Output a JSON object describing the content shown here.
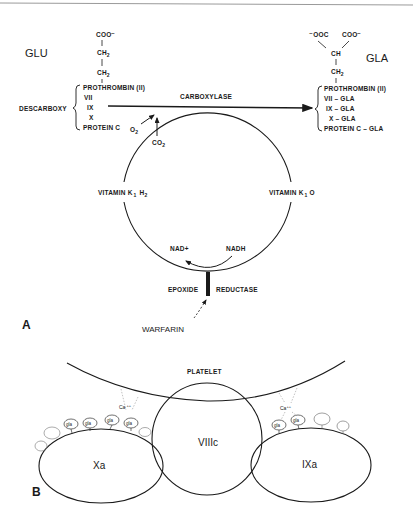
{
  "figure": {
    "panel_a": {
      "label": "A",
      "left": {
        "title": "GLU",
        "structure": [
          "COO⁻",
          "CH",
          "2",
          "CH",
          "2"
        ],
        "group_label": "DESCARBOXY",
        "proteins": [
          "PROTHROMBIN (II)",
          "VII",
          "IX",
          "X",
          "PROTEIN C"
        ]
      },
      "right": {
        "title": "GLA",
        "structure_top_left": "⁻OOC",
        "structure_top_right": "COO⁻",
        "ch": "CH",
        "ch2": "CH",
        "ch2_sub": "2",
        "proteins": [
          "PROTHROMBIN (II)",
          "VII – GLA",
          "IX – GLA",
          "X – GLA",
          "PROTEIN C – GLA"
        ]
      },
      "enzyme_top": "CARBOXYLASE",
      "o2": "O",
      "o2_sub": "2",
      "co2": "CO",
      "co2_sub": "2",
      "cycle_left": "VITAMIN K",
      "cycle_left_sub1": "1",
      "cycle_left_h": "H",
      "cycle_left_sub2": "2",
      "cycle_right": "VITAMIN K",
      "cycle_right_sub": "1",
      "cycle_right_o": "O",
      "nad": "NAD+",
      "nadh": "NADH",
      "enzyme_bottom_left": "EPOXIDE",
      "enzyme_bottom_right": "REDUCTASE",
      "inhibitor": "WARFARIN"
    },
    "panel_b": {
      "label": "B",
      "membrane": "PLATELET",
      "center": "VIIIc",
      "left_factor": "Xa",
      "right_factor": "IXa",
      "gla": "gla",
      "calcium_left": "Ca",
      "calcium_left_sup": "++",
      "calcium_right": "Ca",
      "calcium_right_sup": "++"
    }
  }
}
